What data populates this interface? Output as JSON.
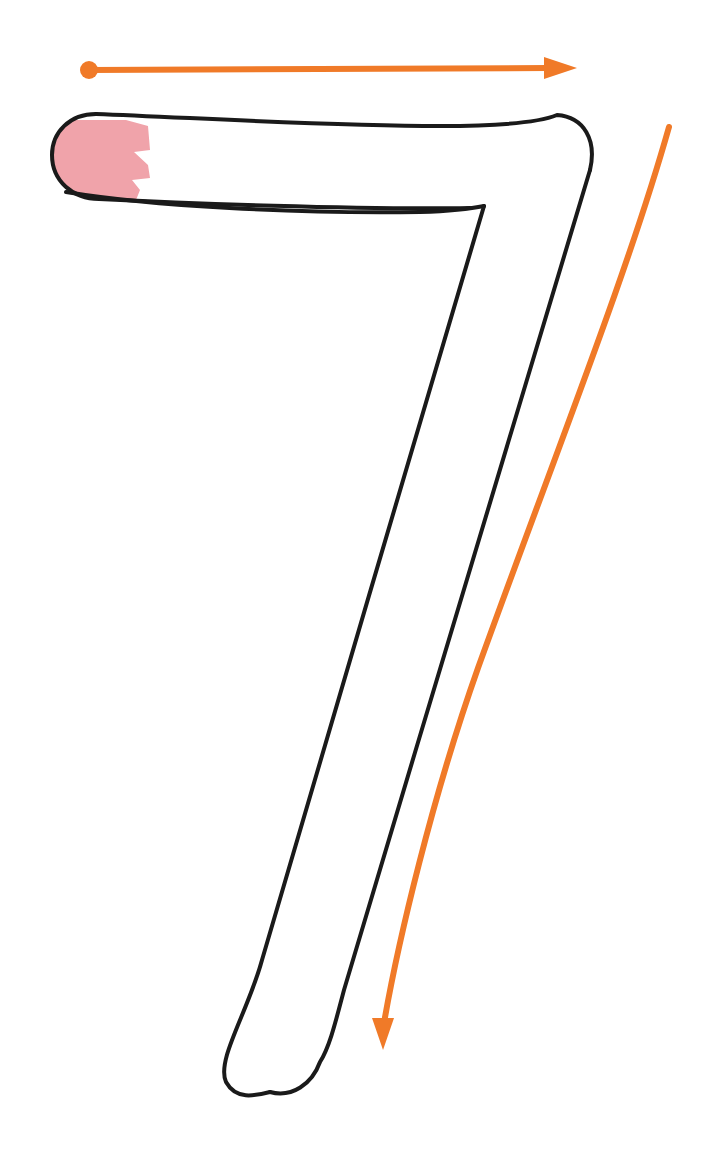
{
  "page": {
    "background_color": "#ffffff",
    "width": 706,
    "height": 1150
  },
  "figure": {
    "name": "digit-seven-stroke-guide",
    "description": "Outlined handwriting glyph of the numeral 7 with directional stroke-order arrows and a highlighted starting region",
    "glyph_character": "7",
    "outline_color": "#1a1a1a",
    "outline_width": 4,
    "fill_color": "#ffffff",
    "start_marker_color": "#F0A3AA",
    "arrow_color": "#F07A28",
    "arrow_width": 6
  },
  "glyph": {
    "name": "seven-outline",
    "outer_path": "M 96 114 C 70 114 52 132 52 155 C 52 180 72 198 98 198 L 440 212 L 240 1010 C 232 1050 240 1078 260 1090 C 282 1102 306 1092 314 1062 L 588 168 C 594 140 582 118 556 115 Z",
    "inner_path": "M 483 205 L 300 1008 C 296 1030 300 1042 310 1046",
    "segments": [
      {
        "name": "horizontal-bar",
        "start": [
          52,
          155
        ],
        "end": [
          555,
          140
        ]
      },
      {
        "name": "diagonal-descender",
        "start": [
          555,
          140
        ],
        "end": [
          262,
          1095
        ]
      }
    ]
  },
  "start_marker": {
    "name": "stroke-start-highlight",
    "shape": "jagged-tipped-rounded-cap",
    "color": "#F0A3AA",
    "bounds": {
      "x": 56,
      "y": 118,
      "width": 100,
      "height": 78
    }
  },
  "arrows": [
    {
      "name": "arrow-horizontal-rightward",
      "label": "stroke 1 direction",
      "direction": "right",
      "color": "#F07A28",
      "start_dot": {
        "cx": 89,
        "cy": 70,
        "r": 9
      },
      "line": {
        "x1": 89,
        "y1": 70,
        "x2": 548,
        "y2": 68
      },
      "head_tip": [
        577,
        68
      ],
      "head_base": [
        546,
        68
      ],
      "head_half_width": 11,
      "has_start_dot": true
    },
    {
      "name": "arrow-diagonal-downward",
      "label": "stroke 2 direction",
      "direction": "down",
      "color": "#F07A28",
      "curve": "M 669 127 C 610 330 520 560 430 830 C 404 910 390 975 383 1021",
      "head_tip": [
        383,
        1050
      ],
      "head_base": [
        383,
        1021
      ],
      "head_half_width": 11,
      "has_start_dot": false
    }
  ],
  "colors": {
    "orange": "#F07A28",
    "pink": "#F0A3AA",
    "ink": "#1a1a1a",
    "paper": "#ffffff"
  }
}
